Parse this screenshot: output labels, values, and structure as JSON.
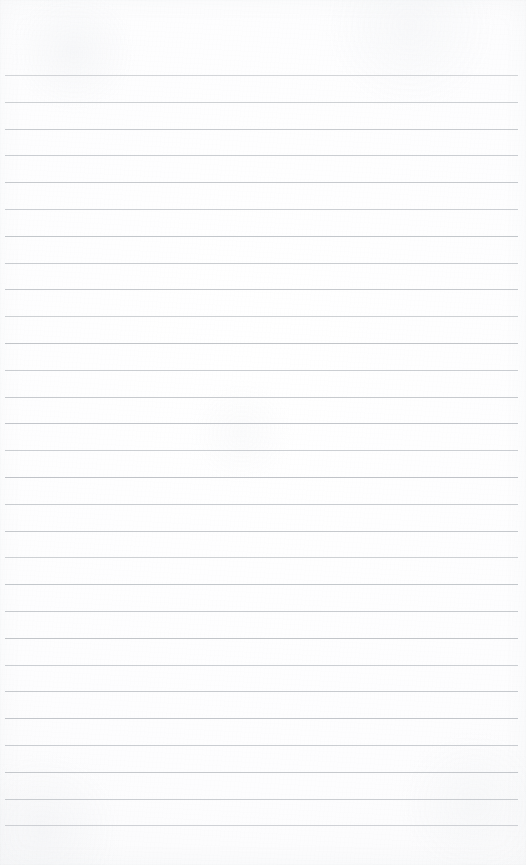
{
  "page": {
    "type": "lined-notebook-page",
    "title": "Blank ruled notebook page",
    "width": 526,
    "height": 865,
    "content_text": "",
    "has_handwriting": false,
    "has_printed_text": false,
    "has_vertical_margin_rule": false,
    "orientation": "portrait"
  },
  "paper": {
    "background_color": "#fdfdfe",
    "highlight_color": "#ffffff",
    "shade_color": "#f6f6f7",
    "texture": "subtle paper grain with faint mottling and soft edge vignette"
  },
  "ruling": {
    "line_color": "#b9bdc2",
    "line_thickness_px": 1,
    "line_spacing_px": 26.8,
    "first_line_y": 75,
    "line_count": 29,
    "left_inset_px": 5,
    "right_inset_px": 8,
    "top_margin_px": 75,
    "bottom_margin_px": 19,
    "style": "wide-ruled horizontal lines only",
    "line_opacities": [
      0.62,
      0.7,
      0.78,
      0.74,
      0.8,
      0.72,
      0.85,
      0.76,
      0.82,
      0.7,
      0.88,
      0.74,
      0.8,
      0.86,
      0.72,
      0.9,
      0.76,
      0.82,
      0.7,
      0.84,
      0.78,
      0.88,
      0.72,
      0.8,
      0.86,
      0.74,
      0.82,
      0.76,
      0.68
    ]
  }
}
